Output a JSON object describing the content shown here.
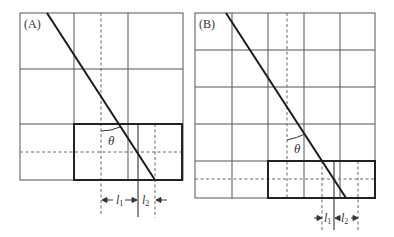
{
  "panels": [
    {
      "id": "A",
      "label": "(A)",
      "theta_label": "θ",
      "l1_label": "l",
      "l1_sub": "1",
      "l2_label": "l",
      "l2_sub": "2"
    },
    {
      "id": "B",
      "label": "(B)",
      "theta_label": "θ",
      "l1_label": "l",
      "l1_sub": "1",
      "l2_label": "l",
      "l2_sub": "2"
    }
  ]
}
